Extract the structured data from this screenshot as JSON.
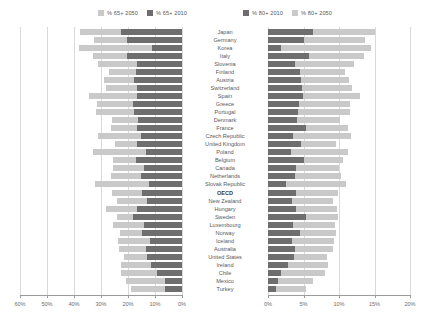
{
  "legend": {
    "left": [
      {
        "label": "% 65+ 2050",
        "color": "#c9c9c9",
        "name": "legend-65-2050"
      },
      {
        "label": "% 65+ 2010",
        "color": "#6e6e6e",
        "name": "legend-65-2010"
      }
    ],
    "right": [
      {
        "label": "% 80+ 2010",
        "color": "#6e6e6e",
        "name": "legend-80-2010"
      },
      {
        "label": "% 80+ 2050",
        "color": "#c9c9c9",
        "name": "legend-80-2050"
      }
    ]
  },
  "colors": {
    "dark": "#6e6e6e",
    "light": "#c9c9c9",
    "grid": "#d9d9d9",
    "axis": "#9a9a9a",
    "text": "#58595b"
  },
  "chart_data": {
    "type": "bar",
    "title": "",
    "orientation": "horizontal",
    "grid": true,
    "legend_position": "top",
    "categories": [
      "Japan",
      "Germany",
      "Korea",
      "Italy",
      "Slovenia",
      "Finland",
      "Austria",
      "Switzerland",
      "Spain",
      "Greece",
      "Portugal",
      "Denmark",
      "France",
      "Czech Republic",
      "United Kingdom",
      "Poland",
      "Belgium",
      "Canada",
      "Netherlands",
      "Slovak Republic",
      "OECD",
      "New Zealand",
      "Hungary",
      "Sweden",
      "Luxembourg",
      "Norway",
      "Iceland",
      "Australia",
      "United States",
      "Ireland",
      "Chile",
      "Mexico",
      "Turkey"
    ],
    "highlight_category": "OECD",
    "panels": [
      {
        "name": "left-panel",
        "xlabel": "",
        "ylabel": "",
        "xlim": [
          0,
          60
        ],
        "reversed": true,
        "ticks": [
          60,
          50,
          40,
          30,
          20,
          10,
          0
        ],
        "tick_labels": [
          "60%",
          "50%",
          "40%",
          "30%",
          "20%",
          "10%",
          "0%"
        ],
        "series": [
          {
            "name": "% 65+ 2010",
            "color": "#6e6e6e",
            "values": [
              22.7,
              20.5,
              11.0,
              20.3,
              16.5,
              17.0,
              17.6,
              16.8,
              16.8,
              18.3,
              17.9,
              16.3,
              16.8,
              15.3,
              16.5,
              13.5,
              17.2,
              14.1,
              15.3,
              12.3,
              14.7,
              13.0,
              16.6,
              18.1,
              14.0,
              14.9,
              12.0,
              13.5,
              13.1,
              11.3,
              9.1,
              6.2,
              6.3
            ]
          },
          {
            "name": "% 65+ 2050",
            "color": "#c9c9c9",
            "values": [
              37.8,
              32.7,
              38.2,
              33.0,
              31.2,
              27.2,
              29.0,
              28.3,
              34.5,
              31.5,
              31.9,
              25.8,
              26.2,
              31.1,
              24.7,
              33.1,
              25.7,
              25.4,
              26.3,
              32.1,
              25.8,
              24.1,
              28.2,
              24.1,
              25.6,
              23.0,
              23.6,
              23.3,
              21.6,
              22.5,
              22.6,
              20.9,
              19.0
            ]
          }
        ]
      },
      {
        "name": "right-panel",
        "xlabel": "",
        "ylabel": "",
        "xlim": [
          0,
          20
        ],
        "reversed": false,
        "ticks": [
          0,
          5,
          10,
          15,
          20
        ],
        "tick_labels": [
          "0%",
          "5%",
          "10%",
          "15%",
          "20%"
        ],
        "series": [
          {
            "name": "% 80+ 2010",
            "color": "#6e6e6e",
            "values": [
              6.3,
              5.1,
              1.9,
              5.8,
              3.8,
              4.5,
              4.7,
              4.8,
              4.9,
              4.4,
              4.2,
              4.1,
              5.3,
              3.5,
              4.6,
              3.3,
              5.0,
              3.9,
              3.8,
              2.6,
              3.9,
              3.4,
              3.9,
              5.3,
              3.5,
              4.5,
              3.4,
              3.8,
              3.7,
              2.8,
              1.9,
              1.4,
              1.1
            ]
          },
          {
            "name": "% 80+ 2050",
            "color": "#c9c9c9",
            "values": [
              15.1,
              13.6,
              14.5,
              13.5,
              12.1,
              10.8,
              11.4,
              11.9,
              13.0,
              11.5,
              11.6,
              10.1,
              11.2,
              11.7,
              9.6,
              11.3,
              10.6,
              10.0,
              10.3,
              11.0,
              9.9,
              9.1,
              9.7,
              9.8,
              9.5,
              9.6,
              9.3,
              9.1,
              8.3,
              8.5,
              8.0,
              6.4,
              5.4
            ]
          }
        ]
      }
    ]
  }
}
